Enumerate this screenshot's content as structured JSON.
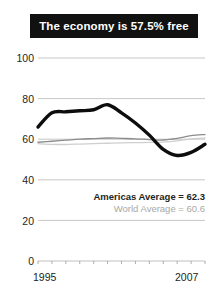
{
  "title": {
    "text": "The economy is 57.5% free",
    "background": "#111111",
    "color": "#ffffff"
  },
  "legend": {
    "americas": "Americas Average = 62.3",
    "world": "World Average = 60.6"
  },
  "chart_data": {
    "type": "line",
    "title": "The economy is 57.5% free",
    "xlabel": "",
    "ylabel": "",
    "xlim": [
      1995,
      2007
    ],
    "ylim": [
      0,
      100
    ],
    "grid": true,
    "legend_position": "inside-lower-right",
    "yticks": [
      0,
      20,
      40,
      60,
      80,
      100
    ],
    "ytick_labels": [
      "0",
      "20",
      "40",
      "60",
      "80",
      "100"
    ],
    "xticks": [
      1995,
      1996,
      1997,
      1998,
      1999,
      2000,
      2001,
      2002,
      2003,
      2004,
      2005,
      2006,
      2007
    ],
    "xtick_labels": [
      "1995",
      "2007"
    ],
    "x": [
      1995,
      1996,
      1997,
      1998,
      1999,
      2000,
      2001,
      2002,
      2003,
      2004,
      2005,
      2006,
      2007
    ],
    "series": [
      {
        "name": "Country economic freedom",
        "color": "#0d0d0d",
        "width": 3.4,
        "values": [
          66.0,
          73.0,
          73.5,
          74.0,
          74.5,
          77.0,
          73.0,
          68.0,
          62.0,
          55.0,
          52.0,
          53.5,
          57.5
        ]
      },
      {
        "name": "Americas Average = 62.3",
        "color": "#8c8c8c",
        "width": 1.3,
        "values": [
          58.5,
          59.0,
          59.5,
          60.0,
          60.3,
          60.6,
          60.4,
          60.2,
          59.8,
          59.6,
          60.4,
          61.8,
          62.3
        ]
      },
      {
        "name": "World Average = 60.6",
        "color": "#cfcfcf",
        "width": 1.3,
        "values": [
          57.8,
          57.5,
          57.4,
          57.6,
          57.8,
          58.0,
          58.2,
          58.3,
          58.4,
          58.6,
          59.2,
          60.2,
          60.6
        ]
      }
    ],
    "annotations": [
      {
        "label": "Americas Average = 62.3",
        "value": 62.3
      },
      {
        "label": "World Average = 60.6",
        "value": 60.6
      }
    ]
  },
  "axes": {
    "y_labels": [
      "100",
      "80",
      "60",
      "40",
      "20",
      "0"
    ],
    "x_labels": [
      "1995",
      "2007"
    ]
  },
  "colors": {
    "gridline": "#b9b9b9",
    "axis_text": "#231f20",
    "main_line": "#0d0d0d",
    "americas_line": "#8c8c8c",
    "world_line": "#cfcfcf"
  }
}
